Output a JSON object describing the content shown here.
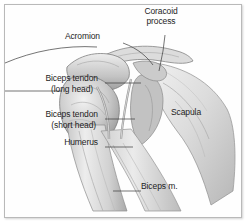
{
  "figure": {
    "style": "grayscale medical line drawing with leader lines",
    "border_color": "#b9b9b9",
    "background_color": "#ffffff",
    "text_color": "#1d1d1d",
    "leader_line_color": "#3a3a3a"
  },
  "labels": [
    {
      "id": "acromion",
      "text": "Acromion",
      "align": "right",
      "x": 120,
      "y": 36
    },
    {
      "id": "coracoid-process-1",
      "text": "Coracoid",
      "align": "center",
      "x": 161,
      "y": 11
    },
    {
      "id": "coracoid-process-2",
      "text": "process",
      "align": "center",
      "x": 161,
      "y": 21
    },
    {
      "id": "biceps-tendon-long-1",
      "text": "Biceps tendon",
      "align": "right",
      "x": 98,
      "y": 78
    },
    {
      "id": "biceps-tendon-long-2",
      "text": "(long head)",
      "align": "right",
      "x": 93,
      "y": 89
    },
    {
      "id": "biceps-tendon-short-1",
      "text": "Biceps tendon",
      "align": "right",
      "x": 98,
      "y": 114
    },
    {
      "id": "biceps-tendon-short-2",
      "text": "(short head)",
      "align": "right",
      "x": 96,
      "y": 125
    },
    {
      "id": "humerus",
      "text": "Humerus",
      "align": "right",
      "x": 98,
      "y": 142
    },
    {
      "id": "scapula",
      "text": "Scapula",
      "align": "left",
      "x": 171,
      "y": 112
    },
    {
      "id": "biceps-muscle",
      "text": "Biceps m.",
      "align": "left",
      "x": 141,
      "y": 186
    }
  ],
  "anatomy_parts": [
    "acromion",
    "coracoid process",
    "clavicle",
    "humeral head",
    "humerus shaft",
    "scapula body",
    "glenoid",
    "biceps tendon long head",
    "biceps tendon short head",
    "biceps muscle"
  ],
  "tones": {
    "bone_light": "#e9e9e9",
    "bone_mid": "#cfcfcf",
    "bone_dark": "#a6a6a6",
    "shadow": "#7d7d7d",
    "outline": "#6e6e6e",
    "muscle_light": "#dedede",
    "muscle_mid": "#bdbdbd"
  }
}
